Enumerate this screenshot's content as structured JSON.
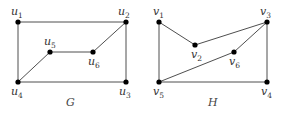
{
  "graphs": [
    {
      "name": "G",
      "vertices": [
        {
          "id": "u1",
          "base": "u",
          "sub": "1",
          "x": 18,
          "y": 22,
          "lx": 11,
          "ly": 15
        },
        {
          "id": "u2",
          "base": "u",
          "sub": "2",
          "x": 126,
          "y": 22,
          "lx": 118,
          "ly": 15
        },
        {
          "id": "u3",
          "base": "u",
          "sub": "3",
          "x": 126,
          "y": 82,
          "lx": 119,
          "ly": 95
        },
        {
          "id": "u4",
          "base": "u",
          "sub": "4",
          "x": 18,
          "y": 82,
          "lx": 11,
          "ly": 95
        },
        {
          "id": "u5",
          "base": "u",
          "sub": "5",
          "x": 50,
          "y": 52,
          "lx": 44,
          "ly": 45
        },
        {
          "id": "u6",
          "base": "u",
          "sub": "6",
          "x": 93,
          "y": 52,
          "lx": 88,
          "ly": 65
        }
      ],
      "edges": [
        [
          "u1",
          "u2"
        ],
        [
          "u1",
          "u4"
        ],
        [
          "u2",
          "u3"
        ],
        [
          "u4",
          "u3"
        ],
        [
          "u2",
          "u6"
        ],
        [
          "u6",
          "u5"
        ],
        [
          "u5",
          "u4"
        ]
      ],
      "label": {
        "text": "G",
        "x": 66,
        "y": 106
      }
    },
    {
      "name": "H",
      "vertices": [
        {
          "id": "v1",
          "base": "v",
          "sub": "1",
          "x": 159,
          "y": 22,
          "lx": 153,
          "ly": 15
        },
        {
          "id": "v2",
          "base": "v",
          "sub": "2",
          "x": 195,
          "y": 45,
          "lx": 191,
          "ly": 58
        },
        {
          "id": "v3",
          "base": "v",
          "sub": "3",
          "x": 267,
          "y": 22,
          "lx": 260,
          "ly": 15
        },
        {
          "id": "v4",
          "base": "v",
          "sub": "4",
          "x": 267,
          "y": 82,
          "lx": 261,
          "ly": 95
        },
        {
          "id": "v5",
          "base": "v",
          "sub": "5",
          "x": 159,
          "y": 82,
          "lx": 153,
          "ly": 95
        },
        {
          "id": "v6",
          "base": "v",
          "sub": "6",
          "x": 234,
          "y": 52,
          "lx": 229,
          "ly": 65
        }
      ],
      "edges": [
        [
          "v1",
          "v2"
        ],
        [
          "v2",
          "v3"
        ],
        [
          "v1",
          "v5"
        ],
        [
          "v3",
          "v4"
        ],
        [
          "v5",
          "v4"
        ],
        [
          "v3",
          "v6"
        ],
        [
          "v6",
          "v5"
        ]
      ],
      "label": {
        "text": "H",
        "x": 208,
        "y": 106
      }
    }
  ]
}
